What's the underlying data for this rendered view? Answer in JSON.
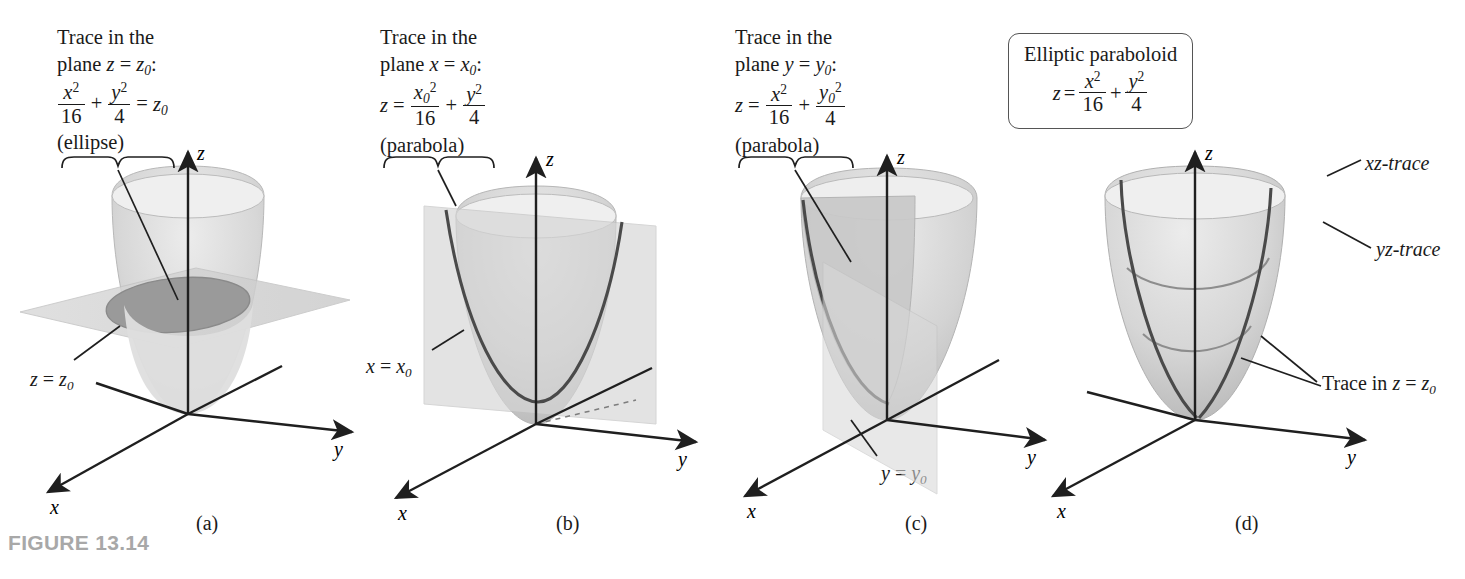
{
  "figure": {
    "label": "FIGURE 13.14"
  },
  "panels": [
    {
      "id": "a",
      "caption": "(a)",
      "callout": {
        "line1": "Trace in the",
        "line2_pre": "plane ",
        "line2_var": "z",
        "line2_eq": " = ",
        "line2_val": "z",
        "line2_sub": "0",
        "line2_colon": ":",
        "eq_num1": "x",
        "eq_num1_sup": "2",
        "eq_den1": "16",
        "eq_plus": "+",
        "eq_num2": "y",
        "eq_num2_sup": "2",
        "eq_den2": "4",
        "eq_equals": "=",
        "eq_rhs": "z",
        "eq_rhs_sub": "0",
        "kind": "(ellipse)"
      },
      "plane_label": {
        "var": "z",
        "eq": " = ",
        "val": "z",
        "sub": "0"
      },
      "axes": {
        "x": "x",
        "y": "y",
        "z": "z"
      }
    },
    {
      "id": "b",
      "caption": "(b)",
      "callout": {
        "line1": "Trace in the",
        "line2_pre": "plane ",
        "line2_var": "x",
        "line2_eq": " = ",
        "line2_val": "x",
        "line2_sub": "0",
        "line2_colon": ":",
        "eq_lhs": "z",
        "eq_equals": "=",
        "eq_num1": "x",
        "eq_num1_sub": "0",
        "eq_num1_sup": "2",
        "eq_den1": "16",
        "eq_plus": "+",
        "eq_num2": "y",
        "eq_num2_sup": "2",
        "eq_den2": "4",
        "kind": "(parabola)"
      },
      "plane_label": {
        "var": "x",
        "eq": " = ",
        "val": "x",
        "sub": "0"
      },
      "axes": {
        "x": "x",
        "y": "y",
        "z": "z"
      }
    },
    {
      "id": "c",
      "caption": "(c)",
      "callout": {
        "line1": "Trace in the",
        "line2_pre": "plane ",
        "line2_var": "y",
        "line2_eq": " = ",
        "line2_val": "y",
        "line2_sub": "0",
        "line2_colon": ":",
        "eq_lhs": "z",
        "eq_equals": "=",
        "eq_num1": "x",
        "eq_num1_sup": "2",
        "eq_den1": "16",
        "eq_plus": "+",
        "eq_num2": "y",
        "eq_num2_sub": "0",
        "eq_num2_sup": "2",
        "eq_den2": "4",
        "kind": "(parabola)"
      },
      "plane_label": {
        "var": "y",
        "eq": " = ",
        "val": "y",
        "sub": "0"
      },
      "axes": {
        "x": "x",
        "y": "y",
        "z": "z"
      }
    },
    {
      "id": "d",
      "caption": "(d)",
      "box": {
        "title": "Elliptic paraboloid",
        "eq_lhs": "z",
        "eq_equals": "=",
        "eq_num1": "x",
        "eq_num1_sup": "2",
        "eq_den1": "16",
        "eq_plus": "+",
        "eq_num2": "y",
        "eq_num2_sup": "2",
        "eq_den2": "4"
      },
      "trace_labels": {
        "xz": "xz-trace",
        "yz": "yz-trace",
        "z0_pre": "Trace in ",
        "z0_var": "z",
        "z0_eq": " = ",
        "z0_val": "z",
        "z0_sub": "0"
      },
      "axes": {
        "x": "x",
        "y": "y",
        "z": "z"
      }
    }
  ],
  "colors": {
    "surface_light": "#dcdcdc",
    "surface_mid": "#c6c6c6",
    "surface_dark": "#a9a9a9",
    "plane": "#d2d2d2",
    "axis": "#1f1f1f",
    "trace": "#4a4a4a",
    "figure_label": "#a8a8a8"
  }
}
